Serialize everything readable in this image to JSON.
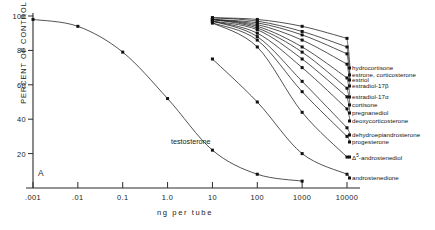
{
  "figure": {
    "panel_label": "A",
    "ylabel": "PERCENT OF CONTROL",
    "xlabel": "ng  per  tube",
    "inline_label": "testosterone"
  },
  "axes": {
    "xticks": [
      ".001",
      ".01",
      "0.1",
      "1.0",
      "10",
      "100",
      "1000",
      "10000"
    ],
    "yticks": [
      "100",
      "80",
      "60",
      "40",
      "20"
    ]
  },
  "legend": [
    {
      "label": "hydrocortisone"
    },
    {
      "label": "estrone, corticosterone"
    },
    {
      "label": "estriol"
    },
    {
      "label": "estradiol-17β"
    },
    {
      "label": "estradiol-17α"
    },
    {
      "label": "cortisone"
    },
    {
      "label": "pregnanediol"
    },
    {
      "label": "deoxycorticosterone"
    },
    {
      "label": "dehydroepiandrosterone"
    },
    {
      "label": "progesterone"
    },
    {
      "label": "Δ⁵-androstenediol"
    },
    {
      "label": "androstenedione"
    }
  ],
  "chart_data": {
    "type": "line",
    "title": "",
    "subtitle": "",
    "xlabel": "ng per tube",
    "ylabel": "PERCENT OF CONTROL",
    "xscale": "log",
    "xlim": [
      0.001,
      10000
    ],
    "ylim": [
      0,
      100
    ],
    "grid": false,
    "legend_position": "right-inline-leader-lines",
    "xtick_values": [
      0.001,
      0.01,
      0.1,
      1.0,
      10,
      100,
      1000,
      10000
    ],
    "ytick_values": [
      100,
      80,
      60,
      40,
      20
    ],
    "annotations": [
      {
        "text": "A",
        "x": 0.0025,
        "y": 11
      },
      {
        "text": "testosterone",
        "x": 3.0,
        "y": 27
      }
    ],
    "series": [
      {
        "name": "testosterone",
        "x": [
          0.001,
          0.01,
          0.1,
          1.0,
          10,
          100,
          1000
        ],
        "values": [
          98,
          94,
          79,
          52,
          22,
          8,
          4
        ]
      },
      {
        "name": "androstenedione",
        "x": [
          10,
          100,
          1000,
          10000
        ],
        "values": [
          75,
          50,
          20,
          8
        ]
      },
      {
        "name": "Δ⁵-androstenediol",
        "x": [
          10,
          100,
          1000,
          10000
        ],
        "values": [
          96,
          82,
          44,
          18
        ]
      },
      {
        "name": "progesterone",
        "x": [
          10,
          100,
          1000,
          10000
        ],
        "values": [
          96,
          86,
          56,
          30
        ]
      },
      {
        "name": "dehydroepiandrosterone",
        "x": [
          10,
          100,
          1000,
          10000
        ],
        "values": [
          97,
          88,
          62,
          35
        ]
      },
      {
        "name": "deoxycorticosterone",
        "x": [
          10,
          100,
          1000,
          10000
        ],
        "values": [
          97,
          90,
          70,
          46
        ]
      },
      {
        "name": "pregnanediol",
        "x": [
          10,
          100,
          1000,
          10000
        ],
        "values": [
          97,
          92,
          75,
          53
        ]
      },
      {
        "name": "cortisone",
        "x": [
          10,
          100,
          1000,
          10000
        ],
        "values": [
          98,
          93,
          79,
          58
        ]
      },
      {
        "name": "estradiol-17α",
        "x": [
          10,
          100,
          1000,
          10000
        ],
        "values": [
          98,
          94,
          82,
          64
        ]
      },
      {
        "name": "estradiol-17β",
        "x": [
          10,
          100,
          1000,
          10000
        ],
        "values": [
          98,
          95,
          86,
          72
        ]
      },
      {
        "name": "estriol",
        "x": [
          10,
          100,
          1000,
          10000
        ],
        "values": [
          98,
          96,
          89,
          78
        ]
      },
      {
        "name": "estrone, corticosterone",
        "x": [
          10,
          100,
          1000,
          10000
        ],
        "values": [
          99,
          97,
          91,
          82
        ]
      },
      {
        "name": "hydrocortisone",
        "x": [
          10,
          100,
          1000,
          10000
        ],
        "values": [
          99,
          98,
          94,
          87
        ]
      }
    ]
  },
  "legend_anchors": {
    "hydrocortisone": 68,
    "estrone, corticosterone": 75,
    "estriol": 80,
    "estradiol-17β": 86,
    "estradiol-17α": 97,
    "cortisone": 105,
    "pregnanediol": 113,
    "deoxycorticosterone": 121,
    "dehydroepiandrosterone": 135,
    "progesterone": 142,
    "Δ⁵-androstenediol": 157,
    "androstenedione": 178
  }
}
